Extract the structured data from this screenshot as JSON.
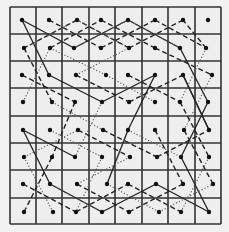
{
  "diagram": {
    "type": "knight-tour-grid",
    "rows": 8,
    "cols": 8,
    "grid": {
      "x_lines": [
        10,
        36,
        62,
        89,
        115,
        142,
        168,
        195,
        221
      ],
      "y_lines": [
        7,
        34,
        61,
        88,
        116,
        143,
        170,
        198,
        224
      ],
      "line_color": "#333333",
      "background": "#eeeeee"
    },
    "dot_color": "#111111",
    "dots": [
      [
        [
          22,
          20
        ],
        [
          49,
          20
        ],
        [
          77,
          20
        ],
        [
          101,
          20
        ],
        [
          128,
          20
        ],
        [
          155,
          20
        ],
        [
          183,
          20
        ],
        [
          208,
          20
        ]
      ],
      [
        [
          24,
          48
        ],
        [
          50,
          48
        ],
        [
          74,
          48
        ],
        [
          101,
          48
        ],
        [
          129,
          48
        ],
        [
          155,
          48
        ],
        [
          180,
          48
        ],
        [
          206,
          48
        ]
      ],
      [
        [
          22,
          75
        ],
        [
          49,
          75
        ],
        [
          76,
          75
        ],
        [
          106,
          75
        ],
        [
          128,
          75
        ],
        [
          155,
          75
        ],
        [
          183,
          75
        ],
        [
          212,
          75
        ]
      ],
      [
        [
          23,
          102
        ],
        [
          52,
          102
        ],
        [
          75,
          102
        ],
        [
          102,
          102
        ],
        [
          129,
          102
        ],
        [
          155,
          102
        ],
        [
          180,
          102
        ],
        [
          208,
          102
        ]
      ],
      [
        [
          23,
          130
        ],
        [
          50,
          130
        ],
        [
          78,
          130
        ],
        [
          103,
          130
        ],
        [
          128,
          130
        ],
        [
          155,
          130
        ],
        [
          184,
          130
        ],
        [
          209,
          130
        ]
      ],
      [
        [
          24,
          157
        ],
        [
          52,
          157
        ],
        [
          75,
          157
        ],
        [
          102,
          157
        ],
        [
          130,
          157
        ],
        [
          157,
          157
        ],
        [
          181,
          157
        ],
        [
          209,
          157
        ]
      ],
      [
        [
          23,
          184
        ],
        [
          50,
          184
        ],
        [
          77,
          184
        ],
        [
          107,
          184
        ],
        [
          128,
          184
        ],
        [
          156,
          184
        ],
        [
          183,
          184
        ],
        [
          213,
          184
        ]
      ],
      [
        [
          24,
          212
        ],
        [
          53,
          212
        ],
        [
          76,
          212
        ],
        [
          102,
          212
        ],
        [
          129,
          212
        ],
        [
          159,
          212
        ],
        [
          181,
          212
        ],
        [
          209,
          212
        ]
      ]
    ],
    "segments": [
      {
        "style": "solid",
        "from": [
          0,
          0
        ],
        "to": [
          1,
          2
        ]
      },
      {
        "style": "solid",
        "from": [
          0,
          0
        ],
        "to": [
          2,
          1
        ]
      },
      {
        "style": "solid",
        "from": [
          1,
          2
        ],
        "to": [
          0,
          4
        ]
      },
      {
        "style": "solid",
        "from": [
          0,
          4
        ],
        "to": [
          1,
          6
        ]
      },
      {
        "style": "solid",
        "from": [
          1,
          6
        ],
        "to": [
          3,
          7
        ]
      },
      {
        "style": "solid",
        "from": [
          3,
          7
        ],
        "to": [
          5,
          6
        ]
      },
      {
        "style": "solid",
        "from": [
          2,
          1
        ],
        "to": [
          3,
          3
        ]
      },
      {
        "style": "solid",
        "from": [
          3,
          3
        ],
        "to": [
          2,
          5
        ]
      },
      {
        "style": "solid",
        "from": [
          2,
          5
        ],
        "to": [
          4,
          4
        ]
      },
      {
        "style": "solid",
        "from": [
          4,
          4
        ],
        "to": [
          6,
          3
        ]
      },
      {
        "style": "solid",
        "from": [
          4,
          0
        ],
        "to": [
          6,
          1
        ]
      },
      {
        "style": "solid",
        "from": [
          4,
          0
        ],
        "to": [
          5,
          2
        ]
      },
      {
        "style": "solid",
        "from": [
          6,
          1
        ],
        "to": [
          7,
          3
        ]
      },
      {
        "style": "solid",
        "from": [
          7,
          3
        ],
        "to": [
          6,
          5
        ]
      },
      {
        "style": "solid",
        "from": [
          6,
          5
        ],
        "to": [
          7,
          7
        ]
      },
      {
        "style": "solid",
        "from": [
          7,
          7
        ],
        "to": [
          5,
          6
        ]
      },
      {
        "style": "solid",
        "from": [
          2,
          6
        ],
        "to": [
          4,
          7
        ]
      },
      {
        "style": "solid",
        "from": [
          4,
          7
        ],
        "to": [
          2,
          6
        ]
      },
      {
        "style": "dashed",
        "from": [
          0,
          1
        ],
        "to": [
          1,
          3
        ]
      },
      {
        "style": "dashed",
        "from": [
          1,
          3
        ],
        "to": [
          0,
          5
        ]
      },
      {
        "style": "dashed",
        "from": [
          0,
          5
        ],
        "to": [
          1,
          7
        ]
      },
      {
        "style": "dashed",
        "from": [
          1,
          7
        ],
        "to": [
          0,
          6
        ]
      },
      {
        "style": "dashed",
        "from": [
          0,
          6
        ],
        "to": [
          1,
          4
        ]
      },
      {
        "style": "dashed",
        "from": [
          1,
          4
        ],
        "to": [
          0,
          2
        ]
      },
      {
        "style": "dashed",
        "from": [
          0,
          2
        ],
        "to": [
          1,
          0
        ]
      },
      {
        "style": "dashed",
        "from": [
          1,
          0
        ],
        "to": [
          3,
          1
        ]
      },
      {
        "style": "dashed",
        "from": [
          1,
          1
        ],
        "to": [
          0,
          3
        ]
      },
      {
        "style": "dashed",
        "from": [
          0,
          3
        ],
        "to": [
          1,
          5
        ]
      },
      {
        "style": "dashed",
        "from": [
          1,
          5
        ],
        "to": [
          2,
          7
        ]
      },
      {
        "style": "dashed",
        "from": [
          2,
          0
        ],
        "to": [
          3,
          2
        ]
      },
      {
        "style": "dashed",
        "from": [
          3,
          2
        ],
        "to": [
          5,
          1
        ]
      },
      {
        "style": "dashed",
        "from": [
          2,
          2
        ],
        "to": [
          3,
          4
        ]
      },
      {
        "style": "dashed",
        "from": [
          3,
          4
        ],
        "to": [
          2,
          6
        ]
      },
      {
        "style": "dashed",
        "from": [
          2,
          4
        ],
        "to": [
          3,
          6
        ]
      },
      {
        "style": "dashed",
        "from": [
          3,
          6
        ],
        "to": [
          5,
          7
        ]
      },
      {
        "style": "dashed",
        "from": [
          4,
          2
        ],
        "to": [
          5,
          4
        ]
      },
      {
        "style": "dashed",
        "from": [
          4,
          3
        ],
        "to": [
          5,
          5
        ]
      },
      {
        "style": "dashed",
        "from": [
          5,
          5
        ],
        "to": [
          4,
          7
        ]
      },
      {
        "style": "dashed",
        "from": [
          4,
          5
        ],
        "to": [
          6,
          6
        ]
      },
      {
        "style": "dashed",
        "from": [
          6,
          0
        ],
        "to": [
          7,
          2
        ]
      },
      {
        "style": "dashed",
        "from": [
          7,
          2
        ],
        "to": [
          6,
          4
        ]
      },
      {
        "style": "dashed",
        "from": [
          6,
          4
        ],
        "to": [
          7,
          6
        ]
      },
      {
        "style": "dashed",
        "from": [
          6,
          2
        ],
        "to": [
          7,
          4
        ]
      },
      {
        "style": "dashed",
        "from": [
          7,
          4
        ],
        "to": [
          6,
          6
        ]
      },
      {
        "style": "dashed",
        "from": [
          7,
          0
        ],
        "to": [
          5,
          1
        ]
      },
      {
        "style": "dashed",
        "from": [
          6,
          7
        ],
        "to": [
          4,
          6
        ]
      },
      {
        "style": "dotted",
        "from": [
          0,
          2
        ],
        "to": [
          1,
          4
        ]
      },
      {
        "style": "dotted",
        "from": [
          0,
          4
        ],
        "to": [
          1,
          2
        ]
      },
      {
        "style": "dotted",
        "from": [
          1,
          0
        ],
        "to": [
          0,
          2
        ]
      },
      {
        "style": "dotted",
        "from": [
          1,
          1
        ],
        "to": [
          2,
          3
        ]
      },
      {
        "style": "dotted",
        "from": [
          1,
          6
        ],
        "to": [
          0,
          4
        ]
      },
      {
        "style": "dotted",
        "from": [
          1,
          7
        ],
        "to": [
          3,
          6
        ]
      },
      {
        "style": "dotted",
        "from": [
          2,
          2
        ],
        "to": [
          1,
          4
        ]
      },
      {
        "style": "dotted",
        "from": [
          2,
          7
        ],
        "to": [
          4,
          6
        ]
      },
      {
        "style": "dotted",
        "from": [
          3,
          0
        ],
        "to": [
          1,
          1
        ]
      },
      {
        "style": "dotted",
        "from": [
          3,
          1
        ],
        "to": [
          4,
          3
        ]
      },
      {
        "style": "dotted",
        "from": [
          3,
          3
        ],
        "to": [
          5,
          2
        ]
      },
      {
        "style": "dotted",
        "from": [
          3,
          5
        ],
        "to": [
          2,
          3
        ]
      },
      {
        "style": "dotted",
        "from": [
          4,
          1
        ],
        "to": [
          5,
          3
        ]
      },
      {
        "style": "dotted",
        "from": [
          4,
          4
        ],
        "to": [
          5,
          6
        ]
      },
      {
        "style": "dotted",
        "from": [
          5,
          0
        ],
        "to": [
          4,
          2
        ]
      },
      {
        "style": "dotted",
        "from": [
          5,
          3
        ],
        "to": [
          7,
          2
        ]
      },
      {
        "style": "dotted",
        "from": [
          5,
          4
        ],
        "to": [
          6,
          2
        ]
      },
      {
        "style": "dotted",
        "from": [
          5,
          7
        ],
        "to": [
          7,
          6
        ]
      },
      {
        "style": "dotted",
        "from": [
          6,
          1
        ],
        "to": [
          7,
          3
        ]
      },
      {
        "style": "dotted",
        "from": [
          6,
          3
        ],
        "to": [
          7,
          5
        ]
      },
      {
        "style": "dotted",
        "from": [
          7,
          1
        ],
        "to": [
          5,
          0
        ]
      },
      {
        "style": "dotted",
        "from": [
          7,
          5
        ],
        "to": [
          6,
          7
        ]
      }
    ]
  }
}
